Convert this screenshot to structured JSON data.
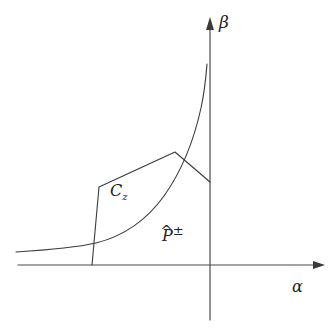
{
  "figure": {
    "background_color": "#ffffff",
    "line_color": "#3a3a3a",
    "axis_color": "#4a4a4a",
    "width": 334,
    "height": 332
  },
  "axes": {
    "horizontal": {
      "name": "alpha-axis",
      "label": "α",
      "x_start": 18,
      "x_end": 325,
      "y": 265,
      "has_arrow": true,
      "label_x": 292,
      "label_y": 279
    },
    "vertical": {
      "name": "beta-axis",
      "label": "β",
      "x": 210,
      "y_top": 18,
      "y_bottom": 320,
      "has_arrow": true,
      "label_x": 219,
      "label_y": 14
    }
  },
  "annotations": [
    {
      "id": "cz",
      "base": "C",
      "subscript": "z",
      "x": 110,
      "y": 183
    },
    {
      "id": "phat",
      "base": "P",
      "accent": "^",
      "superscript": "±",
      "x": 162,
      "y": 224
    }
  ],
  "shapes": {
    "region_cz": {
      "name": "region-cz-polygon",
      "description": "Quadrilateral region labelled C_z with vertices at the alpha axis, upper-left corner, apex, and a descending edge to the beta axis",
      "path": "M 92 265 L 99 187 L 175 152 L 210 182",
      "closed": false
    },
    "curve_phat": {
      "name": "curve-phat-plusminus",
      "description": "Convex increasing curve asymptotic to the beta axis, labelled P-hat plus-minus",
      "path": "M 16 252 C 48 250 74 248 96 243 C 124 236 146 221 164 196 C 181 172 194 140 201 108 C 205 90 206 76 207 64",
      "closed": false
    }
  }
}
